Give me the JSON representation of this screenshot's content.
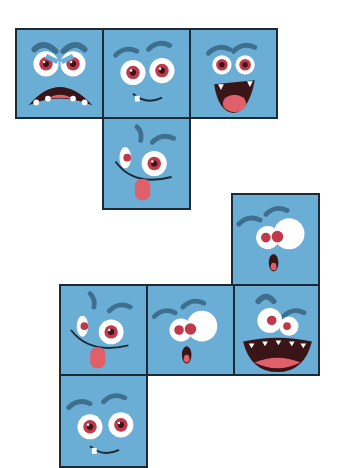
{
  "puzzle": {
    "description": "Two cube nets made of monster-face tiles",
    "colors": {
      "tile": "#6aaed6",
      "border": "#1d2a33",
      "eyebrow": "#3f6f8f",
      "iris": "#c0394a",
      "mouth": "#3a1518",
      "tongue": "#e0606a"
    },
    "net_1": {
      "tiles": [
        {
          "id": "angry-face",
          "expression": "angry, wide open mouth"
        },
        {
          "id": "smirk-face",
          "expression": "sly smirk"
        },
        {
          "id": "laughing-face",
          "expression": "laughing, tongue out"
        },
        {
          "id": "silly-wink-face",
          "expression": "silly, one big eye, tongue out"
        }
      ]
    },
    "net_2": {
      "tiles": [
        {
          "id": "surprised-face-top",
          "expression": "surprised, small o mouth"
        },
        {
          "id": "silly-wink-face-2",
          "expression": "silly, one big eye, tongue out"
        },
        {
          "id": "surprised-face-mid",
          "expression": "surprised, small o mouth"
        },
        {
          "id": "grinning-face",
          "expression": "big grin with teeth"
        },
        {
          "id": "smirk-face-2",
          "expression": "sly smirk"
        }
      ]
    }
  }
}
